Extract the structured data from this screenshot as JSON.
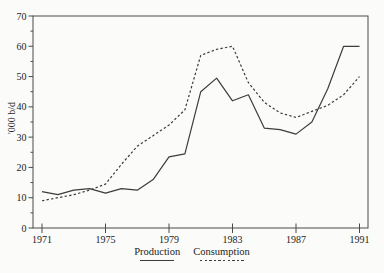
{
  "chart_data": {
    "type": "line",
    "title": "",
    "xlabel": "",
    "ylabel": "'000 b/d",
    "xlim": [
      1971,
      1991
    ],
    "ylim": [
      0,
      70
    ],
    "grid": false,
    "legend_position": "bottom-center",
    "frame": "full-box",
    "line_color": "#3c3c3c",
    "axis_color": "#4a4a4a",
    "background": "#fbfbf9",
    "xticks": [
      1971,
      1975,
      1979,
      1983,
      1987,
      1991
    ],
    "yticks": [
      0,
      10,
      20,
      30,
      40,
      50,
      60,
      70
    ],
    "yticks_minor": [
      5,
      15,
      25,
      35,
      45,
      55,
      65
    ],
    "x": [
      1971,
      1972,
      1973,
      1974,
      1975,
      1976,
      1977,
      1978,
      1979,
      1980,
      1981,
      1982,
      1983,
      1984,
      1985,
      1986,
      1987,
      1988,
      1989,
      1990,
      1991
    ],
    "series": [
      {
        "name": "Production",
        "style": "solid",
        "values": [
          12,
          11,
          12.5,
          13,
          11.5,
          13,
          12.5,
          16,
          23.5,
          24.5,
          45,
          49.5,
          42,
          44,
          33,
          32.5,
          31,
          35,
          46,
          60,
          60
        ]
      },
      {
        "name": "Consumption",
        "style": "dashed",
        "values": [
          9,
          10,
          11,
          12.5,
          14.5,
          21,
          27,
          30.5,
          34,
          39,
          57,
          59,
          60,
          48,
          41.5,
          38,
          36.5,
          38.5,
          40.5,
          44,
          50
        ]
      }
    ]
  }
}
